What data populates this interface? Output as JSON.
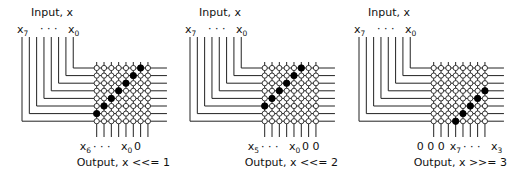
{
  "figure": {
    "colors": {
      "wire": "#222222",
      "open_node": "#ffffff",
      "closed_node": "#000000"
    },
    "grid_size": 8,
    "panels": [
      {
        "id": "shift-left-1",
        "input_title": "Input, x",
        "input_left_label": "x",
        "input_left_sub": "7",
        "input_dots": "· · ·",
        "input_right_label": "x",
        "input_right_sub": "0",
        "output_labels": [
          {
            "text": "x",
            "sub": "6"
          },
          {
            "text": "· · ·",
            "sub": ""
          },
          {
            "text": "x",
            "sub": "0"
          },
          {
            "text": "0",
            "sub": ""
          }
        ],
        "output_title": "Output, x <<= 1",
        "closed_switches": [
          [
            0,
            6
          ],
          [
            1,
            5
          ],
          [
            2,
            4
          ],
          [
            3,
            3
          ],
          [
            4,
            2
          ],
          [
            5,
            1
          ],
          [
            6,
            0
          ]
        ],
        "origin_x": 0
      },
      {
        "id": "shift-left-2",
        "input_title": "Input, x",
        "input_left_label": "x",
        "input_left_sub": "7",
        "input_dots": "· · ·",
        "input_right_label": "x",
        "input_right_sub": "0",
        "output_labels": [
          {
            "text": "x",
            "sub": "5"
          },
          {
            "text": "· · ·",
            "sub": ""
          },
          {
            "text": "x",
            "sub": "0"
          },
          {
            "text": "0 0",
            "sub": ""
          }
        ],
        "output_title": "Output, x <<= 2",
        "closed_switches": [
          [
            0,
            5
          ],
          [
            1,
            4
          ],
          [
            2,
            3
          ],
          [
            3,
            2
          ],
          [
            4,
            1
          ],
          [
            5,
            0
          ]
        ],
        "origin_x": 168
      },
      {
        "id": "shift-right-3",
        "input_title": "Input, x",
        "input_left_label": "x",
        "input_left_sub": "7",
        "input_dots": "· · ·",
        "input_right_label": "x",
        "input_right_sub": "0",
        "output_labels": [
          {
            "text": "0 0 0",
            "sub": ""
          },
          {
            "text": "x",
            "sub": "7"
          },
          {
            "text": "· · ·",
            "sub": ""
          },
          {
            "text": "x",
            "sub": "3"
          }
        ],
        "output_title": "Output, x >>= 3",
        "closed_switches": [
          [
            3,
            7
          ],
          [
            4,
            6
          ],
          [
            5,
            5
          ],
          [
            6,
            4
          ],
          [
            7,
            3
          ]
        ],
        "origin_x": 337
      }
    ]
  }
}
